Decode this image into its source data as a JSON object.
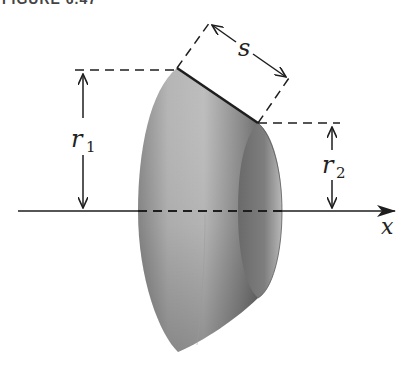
{
  "figure": {
    "caption": "FIGURE 6.47",
    "labels": {
      "slant_length": "s",
      "radius_large": "r",
      "radius_large_sub": "1",
      "radius_small": "r",
      "radius_small_sub": "2",
      "axis": "x"
    },
    "colors": {
      "line": "#1e1e1e",
      "surface_light": "#c8c8c8",
      "surface_dark": "#6e6e6e",
      "inner": "#7a7a7a",
      "background": "#ffffff"
    }
  }
}
